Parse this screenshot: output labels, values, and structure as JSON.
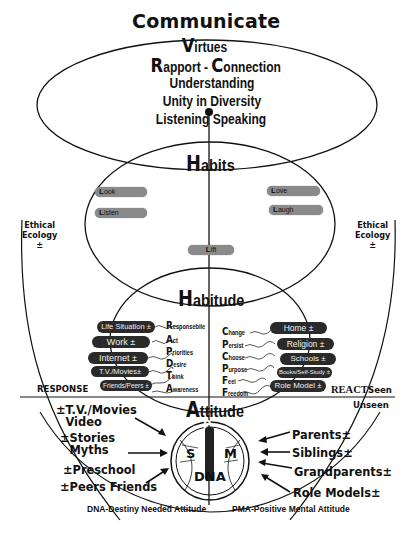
{
  "title": "Communicate",
  "virtues": {
    "cap": "V",
    "rest": "irtues"
  },
  "rapport": {
    "cap1": "R",
    "rest1": "apport - ",
    "cap2": "C",
    "rest2": "onnection"
  },
  "virtue_lines": [
    "Understanding",
    "Unity in Diversity",
    "Listening Speaking"
  ],
  "habits": {
    "cap": "H",
    "rest": "abits",
    "pills": [
      {
        "cap": "L",
        "rest": "ook"
      },
      {
        "cap": "L",
        "rest": "isten"
      },
      {
        "cap": "L",
        "rest": "ove"
      },
      {
        "cap": "L",
        "rest": "augh"
      },
      {
        "cap": "L",
        "rest": "ift"
      }
    ]
  },
  "ethical_ecology": {
    "left": [
      "Ethical",
      "Ecology",
      "±"
    ],
    "right": [
      "Ethical",
      "Ecology",
      "±"
    ]
  },
  "habitude": {
    "cap": "H",
    "rest": "abitude",
    "left_pills": [
      "Life Situation ±",
      "Work ±",
      "Internet ±",
      "T.V./Movies±",
      "Friends/Peers ±"
    ],
    "radpta": [
      {
        "cap": "R",
        "rest": "esponsebile"
      },
      {
        "cap": "A",
        "rest": "ct"
      },
      {
        "cap": "P",
        "rest": "riorities"
      },
      {
        "cap": "D",
        "rest": "esire"
      },
      {
        "cap": "T",
        "rest": "hink"
      },
      {
        "cap": "A",
        "rest": "wareness"
      }
    ],
    "cpcpff": [
      {
        "cap": "C",
        "rest": "hange"
      },
      {
        "cap": "P",
        "rest": "ersist"
      },
      {
        "cap": "C",
        "rest": "hoose"
      },
      {
        "cap": "P",
        "rest": "urpose"
      },
      {
        "cap": "F",
        "rest": "eel"
      },
      {
        "cap": "F",
        "rest": "reedom"
      }
    ],
    "right_pills": [
      "Home ±",
      "Religion ±",
      "Schools ±",
      "Books/Self-Study ±",
      "Role Model ±"
    ]
  },
  "response_label": "RESPONSE",
  "react_label": "REACT",
  "seen_label": "Seen",
  "unseen_label": "Unseen",
  "attitude": {
    "cap": "A",
    "rest": "ttitude",
    "letters": {
      "p": "P",
      "s": "S",
      "m": "M",
      "dna": "DNA"
    }
  },
  "left_influences": [
    [
      "±T.V./Movies",
      "Video"
    ],
    [
      "±Stories",
      "Myths"
    ],
    [
      "±Preschool"
    ],
    [
      "±Peers Friends"
    ]
  ],
  "right_influences": [
    "Parents±",
    "Siblings±",
    "Grandparents±",
    "Role Models±"
  ],
  "footer": {
    "left": "DNA-Destiny Needed Attitude",
    "right": "PMA-Positive Mental Attitude"
  }
}
